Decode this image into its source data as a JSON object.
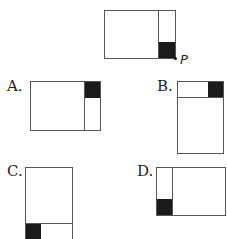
{
  "question": {
    "original_figure": {
      "point_label": "P",
      "description": "Horizontal rectangle divided by vertical line near the right; black square at bottom-right; point P at bottom-right corner"
    }
  },
  "options": [
    {
      "label": "A.",
      "description": "Horizontal rectangle, vertical divider near right, black square top-right"
    },
    {
      "label": "B.",
      "description": "Vertical rectangle, horizontal divider near top, black square top-right"
    },
    {
      "label": "C.",
      "description": "Vertical rectangle, horizontal divider near bottom, black square bottom-left"
    },
    {
      "label": "D.",
      "description": "Horizontal rectangle, vertical divider near left, black square bottom-left"
    }
  ],
  "colors": {
    "stroke": "#555555",
    "fill_black": "#1a1a1a",
    "background": "#ffffff"
  }
}
